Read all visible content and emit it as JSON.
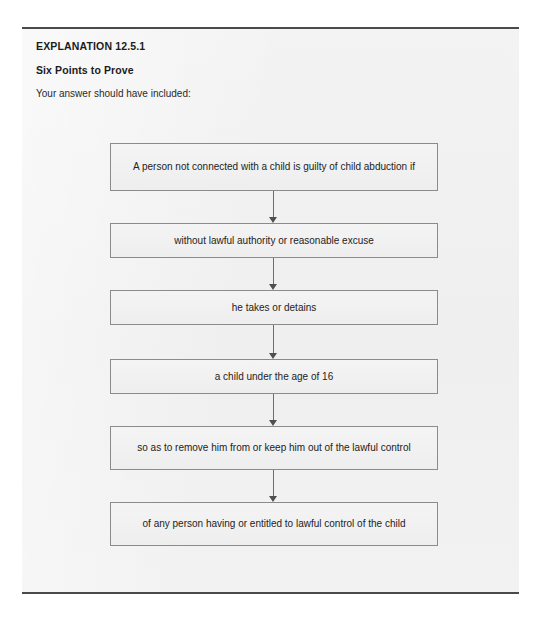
{
  "page": {
    "background_color": "#ffffff"
  },
  "panel": {
    "background_color": "#f1f1f1",
    "border_color": "#4a4a4a"
  },
  "heading": {
    "explanation_label": "EXPLANATION 12.5.1",
    "subtitle": "Six Points to Prove",
    "intro": "Your answer should have included:"
  },
  "flowchart": {
    "type": "flow",
    "orientation": "vertical",
    "node_border_color": "#8b8b8b",
    "node_fill_color": "#f0f0f0",
    "connector_color": "#6e6e6e",
    "nodes": [
      {
        "id": "node-1",
        "label": "A person not connected with a child is guilty of child abduction if",
        "lines": 2
      },
      {
        "id": "node-2",
        "label": "without lawful authority or reasonable excuse",
        "lines": 1
      },
      {
        "id": "node-3",
        "label": "he takes or detains",
        "lines": 1
      },
      {
        "id": "node-4",
        "label": "a child under the age of 16",
        "lines": 1
      },
      {
        "id": "node-5",
        "label": "so as to remove him from or keep him out of the lawful control",
        "lines": 2
      },
      {
        "id": "node-6",
        "label": "of any person having or entitled to lawful control of the child",
        "lines": 2
      }
    ],
    "connectors": [
      {
        "from": "node-1",
        "to": "node-2",
        "arrow": "down-arrow-icon"
      },
      {
        "from": "node-2",
        "to": "node-3",
        "arrow": "down-arrow-icon"
      },
      {
        "from": "node-3",
        "to": "node-4",
        "arrow": "down-arrow-icon"
      },
      {
        "from": "node-4",
        "to": "node-5",
        "arrow": "down-arrow-icon"
      },
      {
        "from": "node-5",
        "to": "node-6",
        "arrow": "down-arrow-icon"
      }
    ]
  }
}
